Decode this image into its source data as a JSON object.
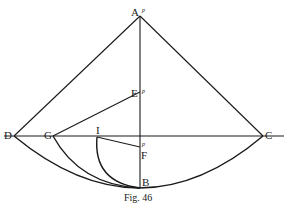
{
  "figure": {
    "caption": "Fig. 46",
    "points": {
      "A": {
        "label": "A",
        "marker": "p"
      },
      "E": {
        "label": "E",
        "marker": "p"
      },
      "F": {
        "label": "F",
        "marker": "p"
      },
      "D": {
        "label": "D"
      },
      "G": {
        "label": "G"
      },
      "I": {
        "label": "I"
      },
      "C": {
        "label": "C"
      },
      "B": {
        "label": "B"
      }
    }
  },
  "colors": {
    "ink": "#1a1a1a",
    "paper": "#ffffff"
  }
}
